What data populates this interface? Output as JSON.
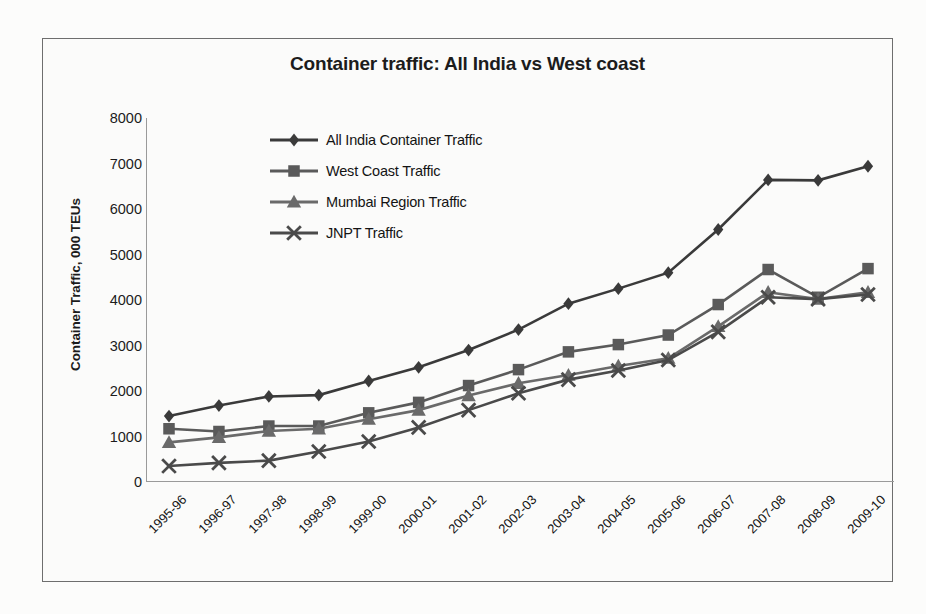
{
  "chart_data": {
    "type": "line",
    "title": "Container traffic:  All India vs West coast",
    "xlabel": "",
    "ylabel": "Container Traffic, 000 TEUs",
    "ylim": [
      0,
      8000
    ],
    "ytick_step": 1000,
    "yticks": [
      "8000",
      "7000",
      "6000",
      "5000",
      "4000",
      "3000",
      "2000",
      "1000",
      "0"
    ],
    "ytick_values": [
      8000,
      7000,
      6000,
      5000,
      4000,
      3000,
      2000,
      1000,
      0
    ],
    "grid": false,
    "legend_position": "upper left",
    "categories": [
      "1995-96",
      "1996-97",
      "1997-98",
      "1998-99",
      "1999-00",
      "2000-01",
      "2001-02",
      "2002-03",
      "2003-04",
      "2004-05",
      "2005-06",
      "2006-07",
      "2007-08",
      "2008-09",
      "2009-10"
    ],
    "series": [
      {
        "name": "All India Container Traffic",
        "marker": "diamond",
        "color": "#3a3a3a",
        "values": [
          1450,
          1680,
          1880,
          1910,
          2220,
          2520,
          2900,
          3350,
          3920,
          4250,
          4600,
          5550,
          6640,
          6630,
          6940
        ]
      },
      {
        "name": "West Coast Traffic",
        "marker": "square",
        "color": "#5a5a5a",
        "values": [
          1170,
          1110,
          1230,
          1230,
          1520,
          1750,
          2120,
          2470,
          2860,
          3020,
          3230,
          3900,
          4670,
          4060,
          4690
        ]
      },
      {
        "name": "Mumbai Region Traffic",
        "marker": "triangle",
        "color": "#6a6a6a",
        "values": [
          870,
          980,
          1120,
          1170,
          1380,
          1580,
          1900,
          2170,
          2350,
          2550,
          2720,
          3420,
          4170,
          4020,
          4170
        ]
      },
      {
        "name": "JNPT Traffic",
        "marker": "cross",
        "color": "#4a4a4a",
        "values": [
          350,
          420,
          470,
          670,
          890,
          1200,
          1580,
          1950,
          2250,
          2450,
          2680,
          3300,
          4060,
          4020,
          4120
        ]
      }
    ]
  },
  "legend": {
    "entries": [
      {
        "label": "All India Container Traffic"
      },
      {
        "label": "West Coast Traffic"
      },
      {
        "label": "Mumbai Region Traffic"
      },
      {
        "label": "JNPT Traffic"
      }
    ]
  }
}
